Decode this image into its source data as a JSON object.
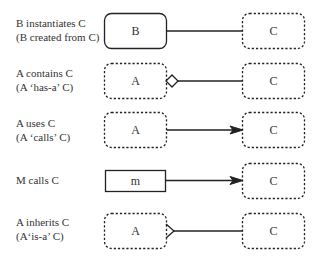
{
  "diagram": {
    "rows": [
      {
        "label_line1": "B instantiates C",
        "label_line2": "(B created from C)",
        "left_box": "B",
        "right_box": "C",
        "relation": "instantiation-line"
      },
      {
        "label_line1": "A contains  C",
        "label_line2": "(A ‘has-a’ C)",
        "left_box": "A",
        "right_box": "C",
        "relation": "aggregation-diamond"
      },
      {
        "label_line1": "A uses C",
        "label_line2": "(A ‘calls’ C)",
        "left_box": "A",
        "right_box": "C",
        "relation": "association-arrow"
      },
      {
        "label_line1": "M calls C",
        "label_line2": "",
        "left_box": "m",
        "right_box": "C",
        "relation": "method-call-arrow"
      },
      {
        "label_line1": "A inherits C",
        "label_line2": "(A‘is-a’ C)",
        "left_box": "A",
        "right_box": "C",
        "relation": "inheritance-triangle"
      }
    ],
    "colors": {
      "stroke": "#222222",
      "text": "#333333",
      "background": "#ffffff"
    }
  }
}
